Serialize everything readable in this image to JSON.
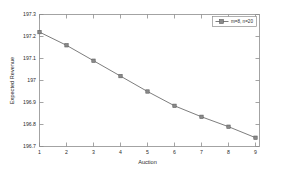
{
  "chart_data": {
    "type": "line",
    "title": "",
    "xlabel": "Auction",
    "ylabel": "Expected Revenue",
    "xlim": [
      1,
      9
    ],
    "ylim": [
      196.7,
      197.3
    ],
    "xticks": [
      "1",
      "2",
      "3",
      "4",
      "5",
      "6",
      "7",
      "8",
      "9"
    ],
    "yticks": [
      "196.7",
      "196.8",
      "196.9",
      "197",
      "197.1",
      "197.2",
      "197.3"
    ],
    "grid": false,
    "legend_position": "top-right",
    "marker": "square",
    "line_style": "solid",
    "series": [
      {
        "name": "m=8, n=20",
        "x": [
          1,
          2,
          3,
          4,
          5,
          6,
          7,
          8,
          9
        ],
        "values": [
          197.22,
          197.16,
          197.09,
          197.02,
          196.95,
          196.885,
          196.835,
          196.79,
          196.74
        ]
      }
    ]
  },
  "figure": {
    "background_color": "#ffffff",
    "axis_color": "#8d8d8d",
    "line_color": "#6e6e6e",
    "marker_color": "#8a8a8a"
  }
}
